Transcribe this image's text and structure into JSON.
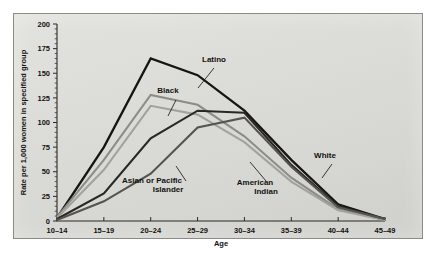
{
  "chart_data": {
    "type": "line",
    "title": "",
    "xlabel": "Age",
    "ylabel": "Rate per 1,000 women in specified group",
    "categories": [
      "10–14",
      "15–19",
      "20–24",
      "25–29",
      "30–34",
      "35–39",
      "40–44",
      "45–49"
    ],
    "ylim": [
      0,
      200
    ],
    "yticks": [
      0,
      25,
      50,
      75,
      100,
      125,
      150,
      175,
      200
    ],
    "ytick_labels": [
      "0",
      "25",
      "50",
      "75",
      "100",
      "125",
      "150",
      "175",
      "200"
    ],
    "y_minor_step": 5,
    "grid": false,
    "legend": "inline-annotations",
    "series": [
      {
        "name": "Latino",
        "color": "#17150f",
        "width": 2.3,
        "values": [
          3,
          75,
          165,
          148,
          112,
          62,
          17,
          2
        ]
      },
      {
        "name": "Black",
        "color": "#8d8d88",
        "width": 2.1,
        "values": [
          4,
          62,
          128,
          118,
          86,
          44,
          12,
          1
        ]
      },
      {
        "name": "American Indian",
        "color": "#a3a39e",
        "width": 2.1,
        "values": [
          3,
          52,
          117,
          108,
          80,
          40,
          11,
          1
        ]
      },
      {
        "name": "White",
        "color": "#2a2824",
        "width": 2.1,
        "values": [
          2,
          28,
          84,
          112,
          110,
          57,
          15,
          2
        ]
      },
      {
        "name": "Asian or Pacific Islander",
        "color": "#56544f",
        "width": 2.1,
        "values": [
          1,
          20,
          48,
          95,
          105,
          55,
          14,
          2
        ]
      }
    ],
    "annotations": [
      {
        "text": "Latino",
        "x": 214,
        "y": 62
      },
      {
        "text": "Black",
        "x": 168,
        "y": 93
      },
      {
        "text": "Asian or Pacific",
        "x": 152,
        "y": 183
      },
      {
        "text": "Islander",
        "x": 168,
        "y": 192
      },
      {
        "text": "American",
        "x": 255,
        "y": 185
      },
      {
        "text": "Indian",
        "x": 266,
        "y": 194
      },
      {
        "text": "White",
        "x": 325,
        "y": 158
      }
    ]
  }
}
